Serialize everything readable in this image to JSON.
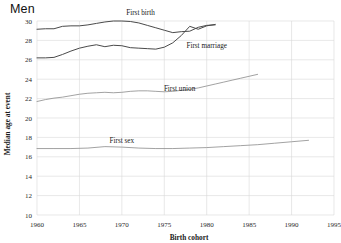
{
  "chart_data": {
    "type": "line",
    "title": "Men",
    "xlabel": "Birth cohort",
    "ylabel": "Median age at event",
    "xlim": [
      1960,
      1995
    ],
    "ylim": [
      10,
      30
    ],
    "xticks": [
      1960,
      1965,
      1970,
      1975,
      1980,
      1985,
      1990,
      1995
    ],
    "yticks": [
      10,
      12,
      14,
      16,
      18,
      20,
      22,
      24,
      26,
      28,
      30
    ],
    "grid": true,
    "legend_position": "inline-annotations",
    "series": [
      {
        "name": "First birth",
        "color": "#4a4a4a",
        "label_x": 1972.2,
        "label_y": 30.6,
        "x": [
          1960,
          1961,
          1962,
          1963,
          1964,
          1965,
          1966,
          1967,
          1968,
          1969,
          1970,
          1971,
          1972,
          1973,
          1974,
          1975,
          1976,
          1977,
          1978,
          1979,
          1980,
          1981
        ],
        "y": [
          29.15,
          29.2,
          29.2,
          29.45,
          29.5,
          29.5,
          29.6,
          29.75,
          29.9,
          30.0,
          30.0,
          29.95,
          29.8,
          29.55,
          29.3,
          29.05,
          28.8,
          28.9,
          28.95,
          29.35,
          29.55,
          29.6
        ]
      },
      {
        "name": "First marriage",
        "color": "#4a4a4a",
        "label_x": 1980.0,
        "label_y": 27.2,
        "x": [
          1960,
          1961,
          1962,
          1963,
          1964,
          1965,
          1966,
          1967,
          1968,
          1969,
          1970,
          1971,
          1972,
          1973,
          1974,
          1975,
          1976,
          1977,
          1978,
          1979,
          1980,
          1981
        ],
        "y": [
          26.2,
          26.2,
          26.25,
          26.55,
          26.9,
          27.2,
          27.4,
          27.55,
          27.35,
          27.5,
          27.45,
          27.25,
          27.2,
          27.15,
          27.1,
          27.3,
          27.75,
          28.5,
          29.45,
          29.15,
          29.5,
          29.65
        ]
      },
      {
        "name": "First union",
        "color": "#8a8a8a",
        "label_x": 1976.8,
        "label_y": 22.8,
        "x": [
          1960,
          1961,
          1962,
          1963,
          1964,
          1965,
          1966,
          1967,
          1968,
          1969,
          1970,
          1971,
          1972,
          1973,
          1974,
          1975,
          1976,
          1977,
          1978,
          1979,
          1980,
          1981,
          1982,
          1983,
          1984,
          1985,
          1986
        ],
        "y": [
          21.7,
          21.9,
          22.05,
          22.15,
          22.3,
          22.45,
          22.55,
          22.6,
          22.65,
          22.6,
          22.65,
          22.75,
          22.8,
          22.8,
          22.75,
          22.7,
          22.75,
          22.85,
          22.95,
          23.1,
          23.3,
          23.5,
          23.7,
          23.9,
          24.1,
          24.3,
          24.5
        ]
      },
      {
        "name": "First sex",
        "color": "#8a8a8a",
        "label_x": 1970.0,
        "label_y": 17.4,
        "x": [
          1960,
          1962,
          1964,
          1966,
          1968,
          1970,
          1972,
          1974,
          1976,
          1978,
          1980,
          1982,
          1984,
          1986,
          1988,
          1990,
          1992
        ],
        "y": [
          16.85,
          16.85,
          16.85,
          16.9,
          17.05,
          17.0,
          16.9,
          16.85,
          16.85,
          16.9,
          16.95,
          17.05,
          17.15,
          17.25,
          17.4,
          17.55,
          17.7
        ]
      }
    ]
  }
}
